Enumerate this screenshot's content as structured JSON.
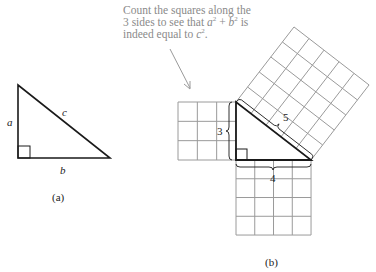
{
  "caption": {
    "line1": "Count the squares along the",
    "line2_prefix": "3 sides to see that ",
    "line2_a": "a",
    "line2_plus": " + ",
    "line2_b": "b",
    "line2_suffix": " is",
    "line3_prefix": "indeed equal to ",
    "line3_c": "c",
    "line3_suffix": ".",
    "exponent": "2"
  },
  "figure_a": {
    "side_labels": {
      "a": "a",
      "b": "b",
      "c": "c"
    },
    "panel_label": "(a)"
  },
  "figure_b": {
    "legs": {
      "a_units": 3,
      "b_units": 4,
      "c_units": 5
    },
    "brace_labels": {
      "a": "3",
      "b": "4",
      "c": "5"
    },
    "panel_label": "(b)"
  },
  "colors": {
    "triangle_stroke": "#1a1a1a",
    "grid_stroke": "#9a9a9a",
    "caption_text": "#8a8a8a",
    "arrow": "#9a9a9a"
  }
}
